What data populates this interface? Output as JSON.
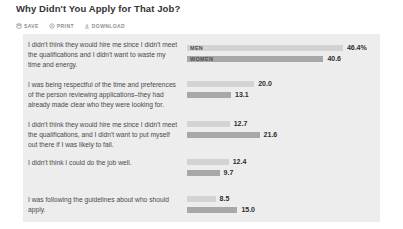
{
  "page": {
    "title": "Why Didn't You Apply for That Job?"
  },
  "toolbar": {
    "save_label": "SAVE",
    "print_label": "PRINT",
    "download_label": "DOWNLOAD"
  },
  "chart_data": {
    "type": "bar",
    "orientation": "horizontal",
    "title": "Why Didn't You Apply for That Job?",
    "unit": "%",
    "xlim": [
      0,
      50
    ],
    "legend_position": "inline-first-row",
    "series_names": [
      "MEN",
      "WOMEN"
    ],
    "categories": [
      "I didn't think they would hire me since I didn't meet the qualifications and I didn't want to waste my time and energy.",
      "I was being respectful of the time and preferences of the person reviewing applications–they had already made clear who they were looking for.",
      "I didn't think they would hire me since I didn't meet the qualifications, and I didn't want to put myself out there if I was likely to fail.",
      "I didn't think I could do the job well.",
      "I was following the guidelines about who should apply."
    ],
    "series": [
      {
        "name": "MEN",
        "values": [
          46.4,
          20.0,
          12.7,
          12.4,
          8.5
        ]
      },
      {
        "name": "WOMEN",
        "values": [
          40.6,
          13.1,
          21.6,
          9.7,
          15.0
        ]
      }
    ],
    "rows": [
      {
        "question": "I didn't think they would hire me since I didn't meet the qualifications and I didn't want to waste my time and energy.",
        "men": 46.4,
        "men_label": "46.4%",
        "women": 40.6,
        "women_label": "40.6"
      },
      {
        "question": "I was being respectful of the time and preferences of the person reviewing applications–they had already made clear who they were looking for.",
        "men": 20.0,
        "men_label": "20.0",
        "women": 13.1,
        "women_label": "13.1"
      },
      {
        "question": "I didn't think they would hire me since I didn't meet the qualifications, and I didn't want to put myself out there if I was likely to fail.",
        "men": 12.7,
        "men_label": "12.7",
        "women": 21.6,
        "women_label": "21.6"
      },
      {
        "question": "I didn't think I could do the job well.",
        "men": 12.4,
        "men_label": "12.4",
        "women": 9.7,
        "women_label": "9.7"
      },
      {
        "question": "I was following the guidelines about who should apply.",
        "men": 8.5,
        "men_label": "8.5",
        "women": 15.0,
        "women_label": "15.0"
      }
    ],
    "colors": {
      "men_bar": "#d3d3d3",
      "women_bar": "#a8a8a8",
      "panel_background": "#ededed",
      "value_text": "#2d2d2d",
      "question_text": "#4a4a4a"
    }
  }
}
